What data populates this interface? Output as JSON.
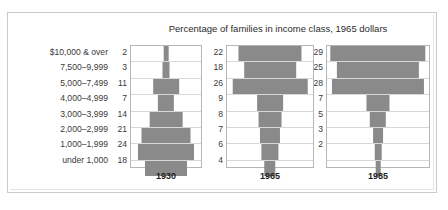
{
  "top_fragment": "",
  "title": "Percentage of families in income class, 1965 dollars",
  "bar_color": "#8a8a8a",
  "row_labels": [
    "$10,000 & over",
    "7,500–9,999",
    "5,000–7,499",
    "4,000–4,999",
    "3,000–3,999",
    "2,000–2,999",
    "1,000–1,999",
    "under 1,000"
  ],
  "panels": [
    {
      "year": "1930",
      "values": [
        "2",
        "3",
        "11",
        "7",
        "14",
        "21",
        "24",
        "18"
      ]
    },
    {
      "year": "1965",
      "values": [
        "22",
        "18",
        "26",
        "9",
        "8",
        "7",
        "6",
        "4"
      ]
    },
    {
      "year": "1985",
      "values": [
        "29",
        "25",
        "28",
        "7",
        "5",
        "3",
        "2",
        ""
      ]
    }
  ],
  "chart_data": {
    "type": "bar",
    "title": "Percentage of families in income class, 1965 dollars",
    "xlabel": "",
    "ylabel": "Income class",
    "orientation": "horizontal-centered-pyramid",
    "grid": true,
    "legend": "none",
    "categories": [
      "$10,000 & over",
      "7,500–9,999",
      "5,000–7,499",
      "4,000–4,999",
      "3,000–3,999",
      "2,000–2,999",
      "1,000–1,999",
      "under 1,000"
    ],
    "series": [
      {
        "name": "1930",
        "values": [
          2,
          3,
          11,
          7,
          14,
          21,
          24,
          18
        ]
      },
      {
        "name": "1965",
        "values": [
          22,
          18,
          26,
          9,
          8,
          7,
          6,
          4
        ]
      },
      {
        "name": "1985",
        "values": [
          29,
          25,
          28,
          7,
          5,
          3,
          2,
          1
        ]
      }
    ],
    "series_max_scale": [
      30,
      30,
      31
    ],
    "note": "1985 bottom category (under 1,000) bar is drawn as a thin stem and its numeric label is not printed."
  }
}
